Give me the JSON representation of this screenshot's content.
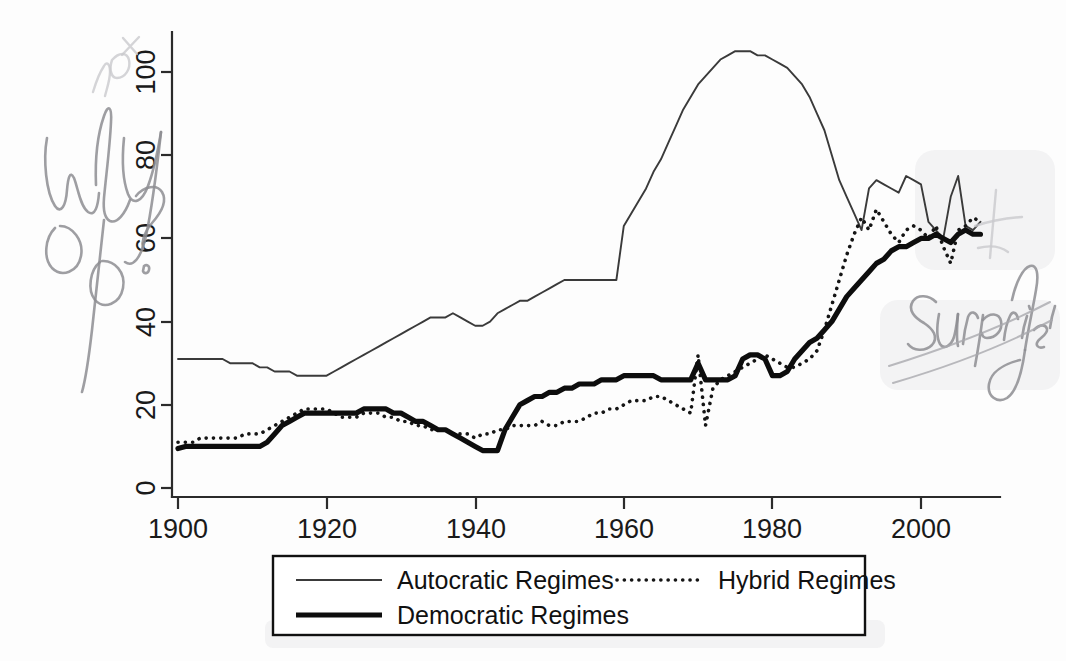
{
  "document": {
    "kind": "scanned-figure-with-handwritten-margin-notes",
    "background_color": "#fdfdfd"
  },
  "annotations": [
    {
      "id": "why-not-percent",
      "text": "why not %?",
      "position": "upper-left-margin",
      "color": "#8d8d92",
      "style": "handwritten-pencil"
    },
    {
      "id": "surprising",
      "text": "surprising",
      "position": "right-margin",
      "color": "#8d8d92",
      "style": "handwritten-pencil-cursive-underlined"
    },
    {
      "id": "check-mark",
      "text": "",
      "position": "upper-right",
      "color": "#c9c9cd",
      "style": "faint-pencil-mark"
    }
  ],
  "chart_data": {
    "type": "line",
    "title": "",
    "subtitle": "",
    "xlabel": "",
    "ylabel": "",
    "xlim": [
      1900,
      2008
    ],
    "ylim": [
      0,
      108
    ],
    "grid": false,
    "legend_position": "bottom-outside",
    "xticks": [
      1900,
      1920,
      1940,
      1960,
      1980,
      2000
    ],
    "xtick_labels": [
      "1900",
      "1920",
      "1940",
      "1960",
      "1980",
      "2000"
    ],
    "yticks": [
      0,
      20,
      40,
      60,
      80,
      100
    ],
    "ytick_labels": [
      "0",
      "20",
      "40",
      "60",
      "80",
      "100"
    ],
    "ytick_label_rotation": 90,
    "x": [
      1900,
      1901,
      1902,
      1903,
      1904,
      1905,
      1906,
      1907,
      1908,
      1909,
      1910,
      1911,
      1912,
      1913,
      1914,
      1915,
      1916,
      1917,
      1918,
      1919,
      1920,
      1921,
      1922,
      1923,
      1924,
      1925,
      1926,
      1927,
      1928,
      1929,
      1930,
      1931,
      1932,
      1933,
      1934,
      1935,
      1936,
      1937,
      1938,
      1939,
      1940,
      1941,
      1942,
      1943,
      1944,
      1945,
      1946,
      1947,
      1948,
      1949,
      1950,
      1951,
      1952,
      1953,
      1954,
      1955,
      1956,
      1957,
      1958,
      1959,
      1960,
      1961,
      1962,
      1963,
      1964,
      1965,
      1966,
      1967,
      1968,
      1969,
      1970,
      1971,
      1972,
      1973,
      1974,
      1975,
      1976,
      1977,
      1978,
      1979,
      1980,
      1981,
      1982,
      1983,
      1984,
      1985,
      1986,
      1987,
      1988,
      1989,
      1990,
      1991,
      1992,
      1993,
      1994,
      1995,
      1996,
      1997,
      1998,
      1999,
      2000,
      2001,
      2002,
      2003,
      2004,
      2005,
      2006,
      2007,
      2008
    ],
    "series": [
      {
        "name": "Autocratic Regimes",
        "line_style": "thin-solid",
        "color": "#3a3a3a",
        "values": [
          31,
          31,
          31,
          31,
          31,
          31,
          31,
          30,
          30,
          30,
          30,
          29,
          29,
          28,
          28,
          28,
          27,
          27,
          27,
          27,
          27,
          28,
          29,
          30,
          31,
          32,
          33,
          34,
          35,
          36,
          37,
          38,
          39,
          40,
          41,
          41,
          41,
          42,
          41,
          40,
          39,
          39,
          40,
          42,
          43,
          44,
          45,
          45,
          46,
          47,
          48,
          49,
          50,
          50,
          50,
          50,
          50,
          50,
          50,
          50,
          63,
          66,
          69,
          72,
          76,
          79,
          83,
          87,
          91,
          94,
          97,
          99,
          101,
          103,
          104,
          105,
          105,
          105,
          104,
          104,
          103,
          102,
          101,
          99,
          97,
          94,
          90,
          86,
          80,
          74,
          70,
          66,
          62,
          72,
          74,
          73,
          72,
          71,
          75,
          74,
          73,
          64,
          62,
          60,
          70,
          75,
          63,
          62,
          64
        ]
      },
      {
        "name": "Hybrid Regimes",
        "line_style": "dotted",
        "color": "#151515",
        "values": [
          11,
          11,
          11,
          12,
          12,
          12,
          12,
          12,
          12,
          13,
          13,
          13,
          14,
          15,
          16,
          17,
          18,
          19,
          19,
          19,
          19,
          18,
          17,
          17,
          17,
          18,
          18,
          18,
          17,
          17,
          16,
          16,
          15,
          15,
          14,
          14,
          14,
          13,
          13,
          13,
          12,
          13,
          13,
          14,
          14,
          15,
          15,
          15,
          15,
          16,
          15,
          15,
          16,
          16,
          16,
          17,
          18,
          18,
          19,
          19,
          20,
          21,
          21,
          21,
          22,
          22,
          21,
          20,
          19,
          18,
          32,
          15,
          24,
          26,
          27,
          28,
          29,
          30,
          31,
          32,
          31,
          30,
          29,
          29,
          30,
          31,
          33,
          38,
          44,
          50,
          56,
          61,
          65,
          62,
          67,
          64,
          61,
          59,
          62,
          63,
          62,
          60,
          63,
          58,
          54,
          62,
          63,
          65,
          64
        ]
      },
      {
        "name": "Democratic Regimes",
        "line_style": "thick-solid",
        "color": "#0d0d0d",
        "values": [
          9.5,
          10,
          10,
          10,
          10,
          10,
          10,
          10,
          10,
          10,
          10,
          10,
          11,
          13,
          15,
          16,
          17,
          18,
          18,
          18,
          18,
          18,
          18,
          18,
          18,
          19,
          19,
          19,
          19,
          18,
          18,
          17,
          16,
          16,
          15,
          14,
          14,
          13,
          12,
          11,
          10,
          9,
          9,
          9,
          14,
          17,
          20,
          21,
          22,
          22,
          23,
          23,
          24,
          24,
          25,
          25,
          25,
          26,
          26,
          26,
          27,
          27,
          27,
          27,
          27,
          26,
          26,
          26,
          26,
          26,
          30,
          26,
          26,
          26,
          26,
          27,
          31,
          32,
          32,
          31,
          27,
          27,
          28,
          31,
          33,
          35,
          36,
          38,
          40,
          43,
          46,
          48,
          50,
          52,
          54,
          55,
          57,
          58,
          58,
          59,
          60,
          60,
          61,
          60,
          59,
          61,
          62,
          61,
          61
        ]
      }
    ]
  },
  "legend": {
    "entries": [
      {
        "label": "Autocratic Regimes",
        "style": "thin-solid"
      },
      {
        "label": "Hybrid Regimes",
        "style": "dotted"
      },
      {
        "label": "Democratic Regimes",
        "style": "thick-solid"
      }
    ]
  }
}
